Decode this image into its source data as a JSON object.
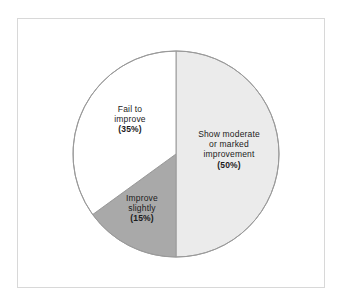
{
  "figure": {
    "background_color": "#ffffff",
    "frame_color": "#d8d8d8"
  },
  "chart_data": {
    "type": "pie",
    "title": "",
    "subtitle": "",
    "xlabel": "",
    "ylabel": "",
    "legend_position": "none",
    "grid": false,
    "start_angle_deg": 0,
    "direction": "clockwise",
    "center": [
      176,
      154
    ],
    "radius": 103,
    "outline_color": "#9a9a9a",
    "categories": [
      "Show moderate or marked improvement",
      "Improve slightly",
      "Fail to improve"
    ],
    "values": [
      50,
      15,
      35
    ],
    "unit": "%",
    "colors": [
      "#ebebeb",
      "#a9a9a9",
      "#ffffff"
    ],
    "slices": [
      {
        "name": "show-moderate-or-marked-improvement",
        "value": 50,
        "percent_label": "(50%)",
        "color": "#ebebeb",
        "label_lines": [
          "Show moderate",
          "or marked",
          "improvement"
        ],
        "start_angle_deg": 0,
        "end_angle_deg": 180
      },
      {
        "name": "improve-slightly",
        "value": 15,
        "percent_label": "(15%)",
        "color": "#a9a9a9",
        "label_lines": [
          "Improve",
          "slightly"
        ],
        "start_angle_deg": 180,
        "end_angle_deg": 234
      },
      {
        "name": "fail-to-improve",
        "value": 35,
        "percent_label": "(35%)",
        "color": "#ffffff",
        "label_lines": [
          "Fail to",
          "improve"
        ],
        "start_angle_deg": 234,
        "end_angle_deg": 360
      }
    ]
  },
  "labels": {
    "major": {
      "line1": "Show moderate",
      "line2": "or marked",
      "line3": "improvement",
      "percent": "(50%)"
    },
    "fail": {
      "line1": "Fail to",
      "line2": "improve",
      "percent": "(35%)"
    },
    "slight": {
      "line1": "Improve",
      "line2": "slightly",
      "percent": "(15%)"
    }
  }
}
